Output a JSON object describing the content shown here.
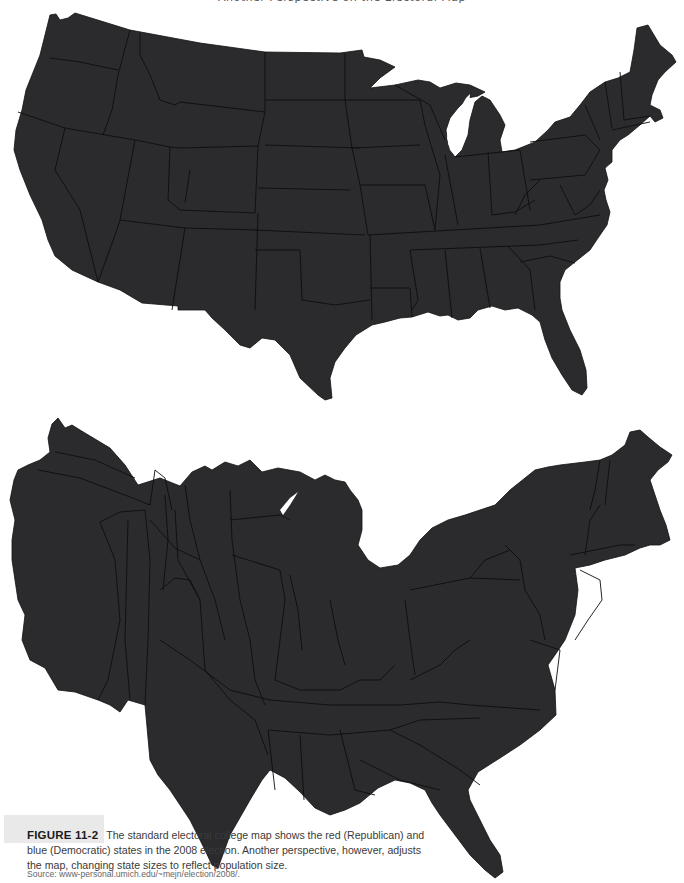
{
  "page_header": "Another Perspective on the Electoral Map",
  "maps": [
    {
      "id": "standard-electoral-map",
      "description": "Standard geographic map of the contiguous United States with state borders",
      "fill_color": "#2b2b2d",
      "border_color": "#0d0d0d"
    },
    {
      "id": "population-cartogram",
      "description": "Cartogram of the contiguous United States with state sizes adjusted to reflect population",
      "fill_color": "#2b2b2d",
      "border_color": "#0d0d0d"
    }
  ],
  "caption": {
    "figure_label": "FIGURE 11-2",
    "text": "The standard electoral college map shows the red (Republican) and blue (Democratic) states in the 2008 election. Another perspective, however, adjusts the map, changing state sizes to reflect population size.",
    "source": "Source: www-personal.umich.edu/~mejn/election/2008/."
  },
  "colors": {
    "background": "#ffffff",
    "land": "#2b2b2d",
    "caption_tab": "#e9e9e9",
    "caption_text": "#3a3a3a"
  }
}
